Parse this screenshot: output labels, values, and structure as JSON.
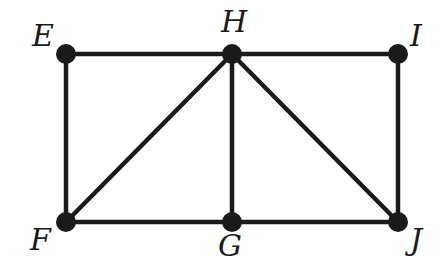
{
  "diagram": {
    "type": "graph",
    "nodes": [
      {
        "id": "E",
        "label": "E",
        "x": 66,
        "y": 54,
        "lx": 32,
        "ly": 46
      },
      {
        "id": "H",
        "label": "H",
        "x": 232,
        "y": 54,
        "lx": 221,
        "ly": 32
      },
      {
        "id": "I",
        "label": "I",
        "x": 398,
        "y": 54,
        "lx": 410,
        "ly": 46
      },
      {
        "id": "F",
        "label": "F",
        "x": 66,
        "y": 222,
        "lx": 30,
        "ly": 250
      },
      {
        "id": "G",
        "label": "G",
        "x": 232,
        "y": 222,
        "lx": 218,
        "ly": 256
      },
      {
        "id": "J",
        "label": "J",
        "x": 398,
        "y": 222,
        "lx": 410,
        "ly": 250
      }
    ],
    "edges": [
      [
        "E",
        "H"
      ],
      [
        "H",
        "I"
      ],
      [
        "E",
        "F"
      ],
      [
        "F",
        "G"
      ],
      [
        "G",
        "J"
      ],
      [
        "I",
        "J"
      ],
      [
        "F",
        "H"
      ],
      [
        "G",
        "H"
      ],
      [
        "H",
        "J"
      ]
    ],
    "color": "#1a1a1a"
  }
}
